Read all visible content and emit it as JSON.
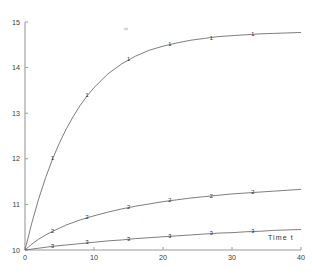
{
  "chart_data": {
    "type": "line",
    "title": "",
    "subtitle": "",
    "xlabel": "Time t",
    "ylabel": "",
    "xlim": [
      0,
      40
    ],
    "ylim": [
      10,
      15
    ],
    "grid": false,
    "legend": "none",
    "legend_note": "series identified by the digit marker plotted on each curve",
    "xticks": [
      0,
      10,
      20,
      30,
      40
    ],
    "xtick_labels": [
      "0",
      "10",
      "20",
      "30",
      "40"
    ],
    "yticks": [
      10,
      11,
      12,
      13,
      14,
      15
    ],
    "ytick_labels": [
      "10",
      "11",
      "12",
      "13",
      "14",
      "15"
    ],
    "series": [
      {
        "name": "1",
        "marker_label": "1",
        "x": [
          0,
          1,
          2,
          3,
          4,
          5,
          6,
          7,
          8,
          9,
          10,
          12,
          14,
          16,
          18,
          20,
          22,
          24,
          26,
          28,
          30,
          32,
          34,
          36,
          38,
          40
        ],
        "values": [
          10.0,
          10.6,
          11.13,
          11.59,
          12.0,
          12.35,
          12.66,
          12.93,
          13.17,
          13.38,
          13.56,
          13.86,
          14.08,
          14.25,
          14.38,
          14.47,
          14.54,
          14.6,
          14.64,
          14.68,
          14.7,
          14.72,
          14.74,
          14.75,
          14.76,
          14.77
        ],
        "markers_x": [
          4,
          9,
          15,
          21,
          27,
          33
        ],
        "markers_y": [
          12.0,
          13.38,
          14.17,
          14.5,
          14.64,
          14.72
        ]
      },
      {
        "name": "2",
        "marker_label": "2",
        "x": [
          0,
          1,
          2,
          3,
          4,
          5,
          6,
          8,
          10,
          12,
          14,
          16,
          18,
          20,
          22,
          24,
          26,
          28,
          30,
          32,
          34,
          36,
          38,
          40
        ],
        "values": [
          10.0,
          10.13,
          10.24,
          10.33,
          10.41,
          10.48,
          10.55,
          10.66,
          10.75,
          10.83,
          10.9,
          10.96,
          11.01,
          11.06,
          11.1,
          11.14,
          11.17,
          11.2,
          11.23,
          11.25,
          11.27,
          11.29,
          11.31,
          11.33
        ],
        "markers_x": [
          4,
          9,
          15,
          21,
          27,
          33
        ],
        "markers_y": [
          10.41,
          10.71,
          10.93,
          11.08,
          11.18,
          11.26
        ]
      },
      {
        "name": "3",
        "marker_label": "3",
        "x": [
          0,
          2,
          4,
          6,
          8,
          10,
          12,
          14,
          16,
          18,
          20,
          22,
          24,
          26,
          28,
          30,
          32,
          34,
          36,
          38,
          40
        ],
        "values": [
          10.0,
          10.04,
          10.08,
          10.11,
          10.14,
          10.17,
          10.2,
          10.22,
          10.25,
          10.27,
          10.29,
          10.31,
          10.33,
          10.35,
          10.37,
          10.38,
          10.4,
          10.41,
          10.43,
          10.44,
          10.45
        ],
        "markers_x": [
          4,
          9,
          15,
          21,
          27,
          33
        ],
        "markers_y": [
          10.08,
          10.16,
          10.24,
          10.3,
          10.36,
          10.41
        ]
      }
    ]
  }
}
